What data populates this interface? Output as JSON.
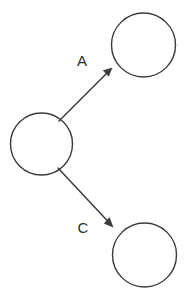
{
  "canvas": {
    "width": 187,
    "height": 293,
    "background_color": "#ffffff",
    "stroke_color": "#3b3b3b",
    "label_color": "#2e2e2e"
  },
  "diagram": {
    "type": "directed-graph",
    "nodes": [
      {
        "id": "node-top-right",
        "label": "",
        "cx": 143.5,
        "cy": 45,
        "r": 32
      },
      {
        "id": "node-left",
        "label": "",
        "cx": 41.5,
        "cy": 144,
        "r": 31
      },
      {
        "id": "node-bottom-right",
        "label": "",
        "cx": 144.5,
        "cy": 255,
        "r": 32
      }
    ],
    "edges": [
      {
        "id": "edge-a",
        "label": "A",
        "from": "node-left",
        "to": "node-top-right",
        "x1": 59,
        "y1": 121,
        "x2": 112,
        "y2": 68,
        "label_x": 82,
        "label_y": 62
      },
      {
        "id": "edge-c",
        "label": "C",
        "from": "node-left",
        "to": "node-bottom-right",
        "x1": 58,
        "y1": 168,
        "x2": 113,
        "y2": 227,
        "label_x": 83,
        "label_y": 229,
        "label_align": "start"
      }
    ]
  }
}
